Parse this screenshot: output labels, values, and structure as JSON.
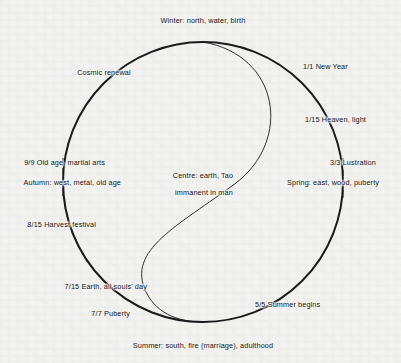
{
  "diagram": {
    "background_color": "#f3f3f1",
    "ink_color": "#16161a",
    "centre": {
      "line1": "Centre: earth, Tao",
      "line2": "immanent in man"
    },
    "cardinals": {
      "top": "Winter: north, water, birth",
      "bottom": "Summer: south, fire (marriage), adulthood",
      "left": "Autumn: west, metal, old age",
      "right": "Spring: east, wood, puberty"
    },
    "markers": [
      {
        "id": "cosmic-renewal",
        "label": "Cosmic renewal",
        "angle_deg": 225
      },
      {
        "id": "new-year",
        "label": "1/1 New Year",
        "angle_deg": 315
      },
      {
        "id": "heaven-light",
        "label": "1/15 Heaven, light",
        "angle_deg": 340
      },
      {
        "id": "lustration",
        "label": "3/3 Lustration",
        "angle_deg": 4
      },
      {
        "id": "summer-begins",
        "label": "5/5 Summer begins",
        "angle_deg": 52
      },
      {
        "id": "puberty",
        "label": "7/7 Puberty",
        "angle_deg": 118
      },
      {
        "id": "all-souls-day",
        "label": "7/15 Earth, all souls' day",
        "angle_deg": 130
      },
      {
        "id": "harvest-festival",
        "label": "8/15 Harvest festival",
        "angle_deg": 160
      },
      {
        "id": "old-age",
        "label": "9/9 Old age, martial arts",
        "angle_deg": 178
      }
    ]
  }
}
